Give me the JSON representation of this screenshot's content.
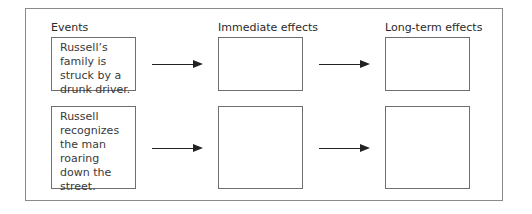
{
  "diagram": {
    "columns": [
      {
        "label": "Events"
      },
      {
        "label": "Immediate effects"
      },
      {
        "label": "Long-term effects"
      }
    ],
    "rows": [
      {
        "event": "Russell’s family is struck by a drunk driver.",
        "immediate_effect": "",
        "long_term_effect": ""
      },
      {
        "event": "Russell recognizes the man roaring down the street.",
        "immediate_effect": "",
        "long_term_effect": ""
      }
    ],
    "connector": "right-arrow"
  }
}
